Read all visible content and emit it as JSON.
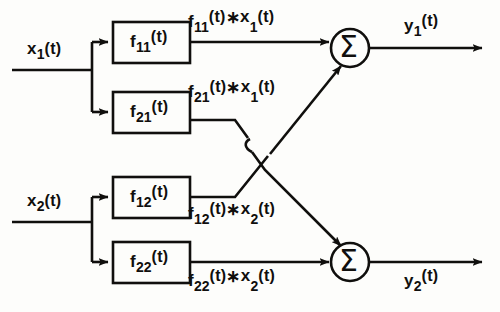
{
  "figure": {
    "type": "signal-flow-block-diagram",
    "stroke_color": "#100f0d",
    "background_color": "#fdfdfb"
  },
  "inputs": [
    {
      "name": "input-x1",
      "base": "x",
      "subscript": "1",
      "arg": "(t)"
    },
    {
      "name": "input-x2",
      "base": "x",
      "subscript": "2",
      "arg": "(t)"
    }
  ],
  "blocks": [
    {
      "name": "block-f11",
      "base": "f",
      "subscript": "11",
      "arg": "(t)"
    },
    {
      "name": "block-f21",
      "base": "f",
      "subscript": "21",
      "arg": "(t)"
    },
    {
      "name": "block-f12",
      "base": "f",
      "subscript": "12",
      "arg": "(t)"
    },
    {
      "name": "block-f22",
      "base": "f",
      "subscript": "22",
      "arg": "(t)"
    }
  ],
  "signals": [
    {
      "name": "signal-f11-conv-x1",
      "f_base": "f",
      "f_sub": "11",
      "f_arg": "(t)",
      "op": "∗",
      "x_base": "x",
      "x_sub": "1",
      "x_arg": "(t)"
    },
    {
      "name": "signal-f21-conv-x1",
      "f_base": "f",
      "f_sub": "21",
      "f_arg": "(t)",
      "op": "∗",
      "x_base": "x",
      "x_sub": "1",
      "x_arg": "(t)"
    },
    {
      "name": "signal-f12-conv-x2",
      "f_base": "f",
      "f_sub": "12",
      "f_arg": "(t)",
      "op": "∗",
      "x_base": "x",
      "x_sub": "2",
      "x_arg": "(t)"
    },
    {
      "name": "signal-f22-conv-x2",
      "f_base": "f",
      "f_sub": "22",
      "f_arg": "(t)",
      "op": "∗",
      "x_base": "x",
      "x_sub": "2",
      "x_arg": "(t)"
    }
  ],
  "adders": [
    {
      "name": "adder-top",
      "glyph": "Σ"
    },
    {
      "name": "adder-bottom",
      "glyph": "Σ"
    }
  ],
  "outputs": [
    {
      "name": "output-y1",
      "base": "y",
      "subscript": "1",
      "arg": "(t)"
    },
    {
      "name": "output-y2",
      "base": "y",
      "subscript": "2",
      "arg": "(t)"
    }
  ]
}
